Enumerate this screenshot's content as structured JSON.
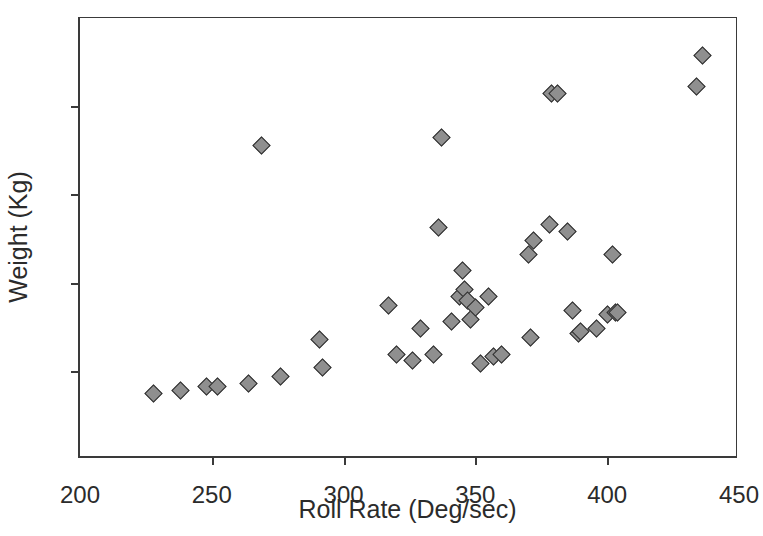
{
  "chart_data": {
    "type": "scatter",
    "title": "",
    "xlabel": "Roll Rate (Deg/sec)",
    "ylabel": "Weight (Kg)",
    "xlim": [
      200,
      450
    ],
    "ylim": [
      100,
      350
    ],
    "xticks": [
      200,
      250,
      300,
      350,
      400,
      450
    ],
    "yticks": [
      100,
      150,
      200,
      250,
      300,
      350
    ],
    "grid": false,
    "legend": null,
    "marker": "diamond",
    "marker_fill": "#8f8f8f",
    "marker_edge": "#2e2e2e",
    "series": [
      {
        "name": "Aircraft",
        "points": [
          [
            228,
            137
          ],
          [
            238,
            139
          ],
          [
            248,
            141
          ],
          [
            252,
            141
          ],
          [
            264,
            143
          ],
          [
            276,
            147
          ],
          [
            269,
            278
          ],
          [
            291,
            168
          ],
          [
            292,
            152
          ],
          [
            317,
            187
          ],
          [
            320,
            159
          ],
          [
            326,
            156
          ],
          [
            329,
            174
          ],
          [
            334,
            159
          ],
          [
            336,
            231
          ],
          [
            337,
            282
          ],
          [
            341,
            178
          ],
          [
            344,
            192
          ],
          [
            345,
            207
          ],
          [
            346,
            196
          ],
          [
            347,
            190
          ],
          [
            348,
            179
          ],
          [
            350,
            186
          ],
          [
            352,
            154
          ],
          [
            355,
            192
          ],
          [
            357,
            158
          ],
          [
            360,
            159
          ],
          [
            370,
            216
          ],
          [
            371,
            169
          ],
          [
            372,
            224
          ],
          [
            378,
            233
          ],
          [
            379,
            307
          ],
          [
            381,
            307
          ],
          [
            385,
            229
          ],
          [
            387,
            184
          ],
          [
            389,
            171
          ],
          [
            390,
            172
          ],
          [
            396,
            174
          ],
          [
            400,
            182
          ],
          [
            402,
            216
          ],
          [
            403,
            183
          ],
          [
            404,
            183
          ],
          [
            434,
            311
          ],
          [
            436,
            329
          ]
        ]
      }
    ]
  }
}
